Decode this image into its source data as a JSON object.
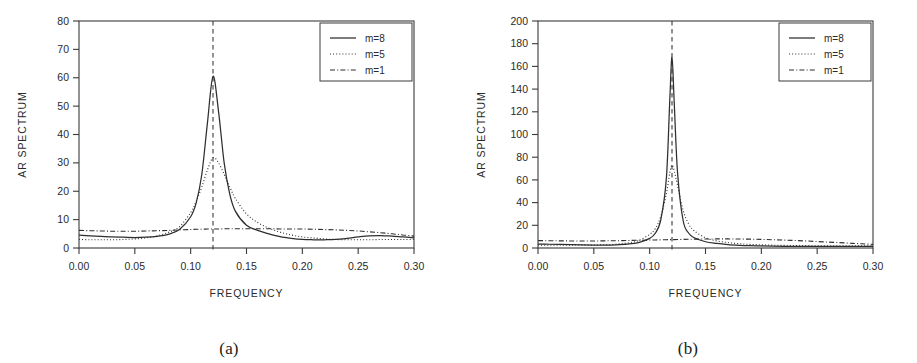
{
  "figure": {
    "panels": [
      {
        "id": "a",
        "caption": "(a)",
        "xlabel": "FREQUENCY",
        "ylabel": "AR SPECTRUM",
        "xticks": [
          "0.00",
          "0.05",
          "0.10",
          "0.15",
          "0.20",
          "0.25",
          "0.30"
        ],
        "yticks": [
          "0",
          "10",
          "20",
          "30",
          "40",
          "50",
          "60",
          "70",
          "80"
        ],
        "legend": [
          "m=8",
          "m=5",
          "m=1"
        ]
      },
      {
        "id": "b",
        "caption": "(b)",
        "xlabel": "FREQUENCY",
        "ylabel": "AR SPECTRUM",
        "xticks": [
          "0.00",
          "0.05",
          "0.10",
          "0.15",
          "0.20",
          "0.25",
          "0.30"
        ],
        "yticks": [
          "0",
          "20",
          "40",
          "60",
          "80",
          "100",
          "120",
          "140",
          "160",
          "180",
          "200"
        ],
        "legend": [
          "m=8",
          "m=5",
          "m=1"
        ]
      }
    ]
  },
  "chart_data": [
    {
      "type": "line",
      "panel": "a",
      "title": "",
      "xlabel": "FREQUENCY",
      "ylabel": "AR SPECTRUM",
      "xlim": [
        0.0,
        0.3
      ],
      "ylim": [
        0,
        80
      ],
      "xticks": [
        0.0,
        0.05,
        0.1,
        0.15,
        0.2,
        0.25,
        0.3
      ],
      "yticks": [
        0,
        10,
        20,
        30,
        40,
        50,
        60,
        70,
        80
      ],
      "grid": false,
      "legend_position": "top-right",
      "annotations": [
        {
          "type": "vline",
          "x": 0.12,
          "style": "dashed",
          "label": ""
        }
      ],
      "x": [
        0.0,
        0.01,
        0.02,
        0.03,
        0.04,
        0.05,
        0.06,
        0.07,
        0.08,
        0.09,
        0.1,
        0.105,
        0.11,
        0.115,
        0.12,
        0.125,
        0.13,
        0.135,
        0.14,
        0.15,
        0.16,
        0.17,
        0.18,
        0.19,
        0.2,
        0.21,
        0.22,
        0.23,
        0.24,
        0.25,
        0.26,
        0.27,
        0.28,
        0.29,
        0.3
      ],
      "series": [
        {
          "name": "m=8",
          "style": "solid",
          "values": [
            4.5,
            4.3,
            4.1,
            3.9,
            3.8,
            3.7,
            3.8,
            4.1,
            4.8,
            6.5,
            11.0,
            16.0,
            26.0,
            44.0,
            60.5,
            48.0,
            30.0,
            19.0,
            13.0,
            8.0,
            6.2,
            5.0,
            4.0,
            3.4,
            3.0,
            2.9,
            2.9,
            3.0,
            3.4,
            3.9,
            4.3,
            4.4,
            4.2,
            3.9,
            3.6
          ]
        },
        {
          "name": "m=5",
          "style": "dotted",
          "values": [
            3.0,
            2.9,
            2.9,
            2.9,
            3.0,
            3.2,
            3.6,
            4.3,
            5.5,
            7.5,
            12.5,
            16.5,
            21.5,
            27.5,
            31.8,
            30.0,
            26.0,
            21.5,
            17.5,
            12.0,
            9.0,
            7.0,
            5.6,
            4.6,
            3.9,
            3.5,
            3.2,
            3.0,
            2.9,
            2.9,
            2.9,
            3.0,
            3.0,
            3.0,
            3.0
          ]
        },
        {
          "name": "m=1",
          "style": "dashdot",
          "values": [
            6.2,
            6.1,
            6.0,
            5.9,
            5.9,
            5.9,
            6.0,
            6.1,
            6.2,
            6.4,
            6.5,
            6.6,
            6.6,
            6.7,
            6.7,
            6.7,
            6.8,
            6.8,
            6.8,
            6.8,
            6.8,
            6.8,
            6.7,
            6.7,
            6.7,
            6.6,
            6.5,
            6.4,
            6.2,
            6.0,
            5.7,
            5.4,
            5.0,
            4.6,
            4.2
          ]
        }
      ]
    },
    {
      "type": "line",
      "panel": "b",
      "title": "",
      "xlabel": "FREQUENCY",
      "ylabel": "AR SPECTRUM",
      "xlim": [
        0.0,
        0.3
      ],
      "ylim": [
        0,
        200
      ],
      "xticks": [
        0.0,
        0.05,
        0.1,
        0.15,
        0.2,
        0.25,
        0.3
      ],
      "yticks": [
        0,
        20,
        40,
        60,
        80,
        100,
        120,
        140,
        160,
        180,
        200
      ],
      "grid": false,
      "legend_position": "top-right",
      "annotations": [
        {
          "type": "vline",
          "x": 0.12,
          "style": "dashed",
          "label": ""
        }
      ],
      "x": [
        0.0,
        0.01,
        0.02,
        0.03,
        0.04,
        0.05,
        0.06,
        0.07,
        0.08,
        0.09,
        0.1,
        0.105,
        0.11,
        0.115,
        0.118,
        0.12,
        0.122,
        0.125,
        0.13,
        0.135,
        0.14,
        0.15,
        0.16,
        0.17,
        0.18,
        0.19,
        0.2,
        0.21,
        0.22,
        0.23,
        0.24,
        0.25,
        0.26,
        0.27,
        0.28,
        0.29,
        0.3
      ],
      "series": [
        {
          "name": "m=8",
          "style": "solid",
          "values": [
            3.5,
            3.3,
            3.1,
            2.9,
            2.7,
            2.6,
            2.6,
            2.8,
            3.4,
            4.8,
            8.5,
            13.0,
            25.0,
            62.0,
            130.0,
            168.0,
            128.0,
            66.0,
            24.0,
            13.0,
            9.0,
            5.5,
            4.0,
            3.0,
            2.4,
            2.0,
            1.8,
            1.6,
            1.5,
            1.4,
            1.4,
            1.4,
            1.4,
            1.4,
            1.4,
            1.4,
            1.4
          ]
        },
        {
          "name": "m=5",
          "style": "dotted",
          "values": [
            2.6,
            2.5,
            2.5,
            2.5,
            2.5,
            2.6,
            2.9,
            3.4,
            4.4,
            6.5,
            12.0,
            17.0,
            28.0,
            48.0,
            66.0,
            73.0,
            68.0,
            55.0,
            33.0,
            21.0,
            15.0,
            9.0,
            6.3,
            4.8,
            3.8,
            3.2,
            2.8,
            2.5,
            2.3,
            2.2,
            2.1,
            2.0,
            2.0,
            2.0,
            2.0,
            2.0,
            2.0
          ]
        },
        {
          "name": "m=1",
          "style": "dashdot",
          "values": [
            6.5,
            6.4,
            6.3,
            6.2,
            6.2,
            6.2,
            6.3,
            6.4,
            6.6,
            6.8,
            7.0,
            7.1,
            7.2,
            7.3,
            7.4,
            7.4,
            7.4,
            7.5,
            7.6,
            7.7,
            7.8,
            7.9,
            8.0,
            8.0,
            7.9,
            7.8,
            7.6,
            7.3,
            7.0,
            6.6,
            6.2,
            5.7,
            5.2,
            4.7,
            4.2,
            3.7,
            3.2
          ]
        }
      ]
    }
  ]
}
